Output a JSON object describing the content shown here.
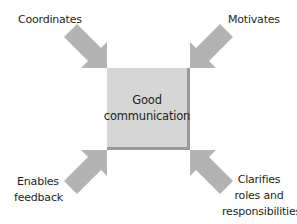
{
  "diagram": {
    "type": "radial-arrows-to-center",
    "center": {
      "label_lines": [
        "Good",
        "communication"
      ]
    },
    "spokes": [
      {
        "position": "top-left",
        "label_lines": [
          "Coordinates"
        ],
        "direction": "inward"
      },
      {
        "position": "top-right",
        "label_lines": [
          "Motivates"
        ],
        "direction": "inward"
      },
      {
        "position": "bottom-left",
        "label_lines": [
          "Enables",
          "feedback"
        ],
        "direction": "inward"
      },
      {
        "position": "bottom-right",
        "label_lines": [
          "Clarifies",
          "roles and",
          "responsibilities"
        ],
        "direction": "inward"
      }
    ],
    "colors": {
      "arrow": "#b3b3b3",
      "box_fill": "#d6d6d6",
      "box_shadow": "#9a9a9a",
      "text": "#231f20",
      "background": "#ffffff"
    }
  }
}
